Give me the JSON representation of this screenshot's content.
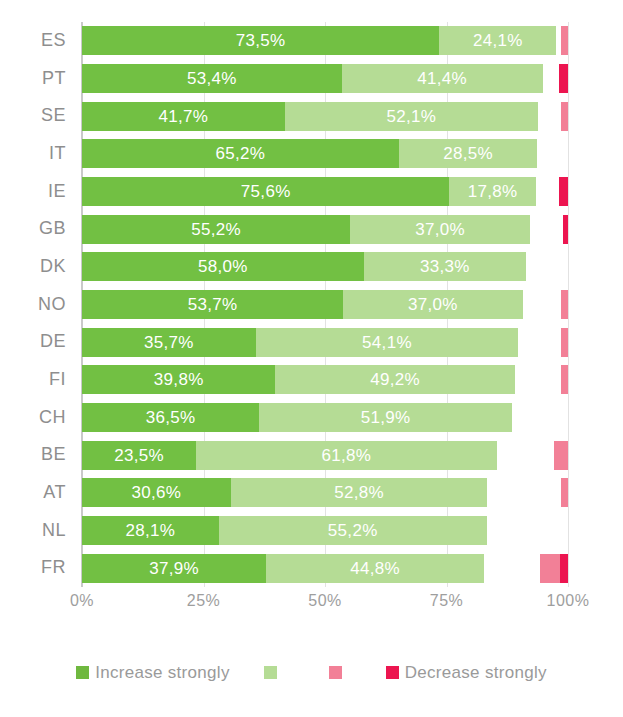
{
  "chart_data": {
    "type": "bar",
    "orientation": "horizontal",
    "stacked": true,
    "stack_mode": "percent",
    "title": "",
    "subtitle": "",
    "xlabel": "",
    "ylabel": "",
    "xlim": [
      0,
      100
    ],
    "xticks": [
      "0%",
      "25%",
      "50%",
      "75%",
      "100%"
    ],
    "xtick_values": [
      0,
      25,
      50,
      75,
      100
    ],
    "grid": true,
    "grid_axis": "x",
    "legend_position": "bottom",
    "decimal_separator": ",",
    "value_label_suffix": "%",
    "categories": [
      "ES",
      "PT",
      "SE",
      "IT",
      "IE",
      "GB",
      "DK",
      "NO",
      "DE",
      "FI",
      "CH",
      "BE",
      "AT",
      "NL",
      "FR"
    ],
    "series": [
      {
        "name": "Increase strongly",
        "key": "increase_strongly",
        "color": "#72c043",
        "labelled": true,
        "values": [
          73.5,
          53.4,
          41.7,
          65.2,
          75.6,
          55.2,
          58.0,
          53.7,
          35.7,
          39.8,
          36.5,
          23.5,
          30.6,
          28.1,
          37.9
        ]
      },
      {
        "name": "",
        "key": "increase",
        "color": "#b5dc95",
        "labelled": true,
        "values": [
          24.1,
          41.4,
          52.1,
          28.5,
          17.8,
          37.0,
          33.3,
          37.0,
          54.1,
          49.2,
          51.9,
          61.8,
          52.8,
          55.2,
          44.8
        ]
      },
      {
        "name": "",
        "key": "decrease",
        "color": "#f28097",
        "labelled": false,
        "values": [
          1.4,
          0.0,
          1.5,
          0.0,
          0.0,
          0.0,
          0.0,
          1.5,
          1.4,
          1.4,
          0.0,
          2.9,
          1.4,
          0.0,
          4.1
        ]
      },
      {
        "name": "Decrease strongly",
        "key": "decrease_strongly",
        "color": "#ec1550",
        "labelled": false,
        "values": [
          0.0,
          1.9,
          0.0,
          0.0,
          1.9,
          1.0,
          0.0,
          0.0,
          0.0,
          0.0,
          0.0,
          0.0,
          0.0,
          0.0,
          1.7
        ]
      }
    ],
    "bars": [
      {
        "category": "ES",
        "increase_strongly": 73.5,
        "increase": 24.1,
        "decrease": 1.4,
        "decrease_strongly": 0.0,
        "label_increase_strongly": "73,5%",
        "label_increase": "24,1%"
      },
      {
        "category": "PT",
        "increase_strongly": 53.4,
        "increase": 41.4,
        "decrease": 0.0,
        "decrease_strongly": 1.9,
        "label_increase_strongly": "53,4%",
        "label_increase": "41,4%"
      },
      {
        "category": "SE",
        "increase_strongly": 41.7,
        "increase": 52.1,
        "decrease": 1.5,
        "decrease_strongly": 0.0,
        "label_increase_strongly": "41,7%",
        "label_increase": "52,1%"
      },
      {
        "category": "IT",
        "increase_strongly": 65.2,
        "increase": 28.5,
        "decrease": 0.0,
        "decrease_strongly": 0.0,
        "label_increase_strongly": "65,2%",
        "label_increase": "28,5%"
      },
      {
        "category": "IE",
        "increase_strongly": 75.6,
        "increase": 17.8,
        "decrease": 0.0,
        "decrease_strongly": 1.9,
        "label_increase_strongly": "75,6%",
        "label_increase": "17,8%"
      },
      {
        "category": "GB",
        "increase_strongly": 55.2,
        "increase": 37.0,
        "decrease": 0.0,
        "decrease_strongly": 1.0,
        "label_increase_strongly": "55,2%",
        "label_increase": "37,0%"
      },
      {
        "category": "DK",
        "increase_strongly": 58.0,
        "increase": 33.3,
        "decrease": 0.0,
        "decrease_strongly": 0.0,
        "label_increase_strongly": "58,0%",
        "label_increase": "33,3%"
      },
      {
        "category": "NO",
        "increase_strongly": 53.7,
        "increase": 37.0,
        "decrease": 1.5,
        "decrease_strongly": 0.0,
        "label_increase_strongly": "53,7%",
        "label_increase": "37,0%"
      },
      {
        "category": "DE",
        "increase_strongly": 35.7,
        "increase": 54.1,
        "decrease": 1.4,
        "decrease_strongly": 0.0,
        "label_increase_strongly": "35,7%",
        "label_increase": "54,1%"
      },
      {
        "category": "FI",
        "increase_strongly": 39.8,
        "increase": 49.2,
        "decrease": 1.4,
        "decrease_strongly": 0.0,
        "label_increase_strongly": "39,8%",
        "label_increase": "49,2%"
      },
      {
        "category": "CH",
        "increase_strongly": 36.5,
        "increase": 51.9,
        "decrease": 0.0,
        "decrease_strongly": 0.0,
        "label_increase_strongly": "36,5%",
        "label_increase": "51,9%"
      },
      {
        "category": "BE",
        "increase_strongly": 23.5,
        "increase": 61.8,
        "decrease": 2.9,
        "decrease_strongly": 0.0,
        "label_increase_strongly": "23,5%",
        "label_increase": "61,8%"
      },
      {
        "category": "AT",
        "increase_strongly": 30.6,
        "increase": 52.8,
        "decrease": 1.4,
        "decrease_strongly": 0.0,
        "label_increase_strongly": "30,6%",
        "label_increase": "52,8%"
      },
      {
        "category": "NL",
        "increase_strongly": 28.1,
        "increase": 55.2,
        "decrease": 0.0,
        "decrease_strongly": 0.0,
        "label_increase_strongly": "28,1%",
        "label_increase": "55,2%"
      },
      {
        "category": "FR",
        "increase_strongly": 37.9,
        "increase": 44.8,
        "decrease": 4.1,
        "decrease_strongly": 1.7,
        "label_increase_strongly": "37,9%",
        "label_increase": "44,8%"
      }
    ],
    "legend": [
      {
        "label": "Increase strongly",
        "color": "#6fb83f",
        "swatch": "sw-inc-strong"
      },
      {
        "label": "",
        "color": "#b5dc95",
        "swatch": "sw-inc"
      },
      {
        "label": "",
        "color": "#f28097",
        "swatch": "sw-dec"
      },
      {
        "label": "Decrease strongly",
        "color": "#ec1550",
        "swatch": "sw-dec-strong"
      }
    ]
  },
  "colors": {
    "increase_strongly": "#72c043",
    "increase": "#b5dc95",
    "decrease": "#f28097",
    "decrease_strongly": "#ec1550",
    "gridline": "#e2e2e2",
    "axis": "#c9c9c9",
    "text": "#8e8e8e",
    "value_label": "#ffffff",
    "background": "#ffffff"
  }
}
